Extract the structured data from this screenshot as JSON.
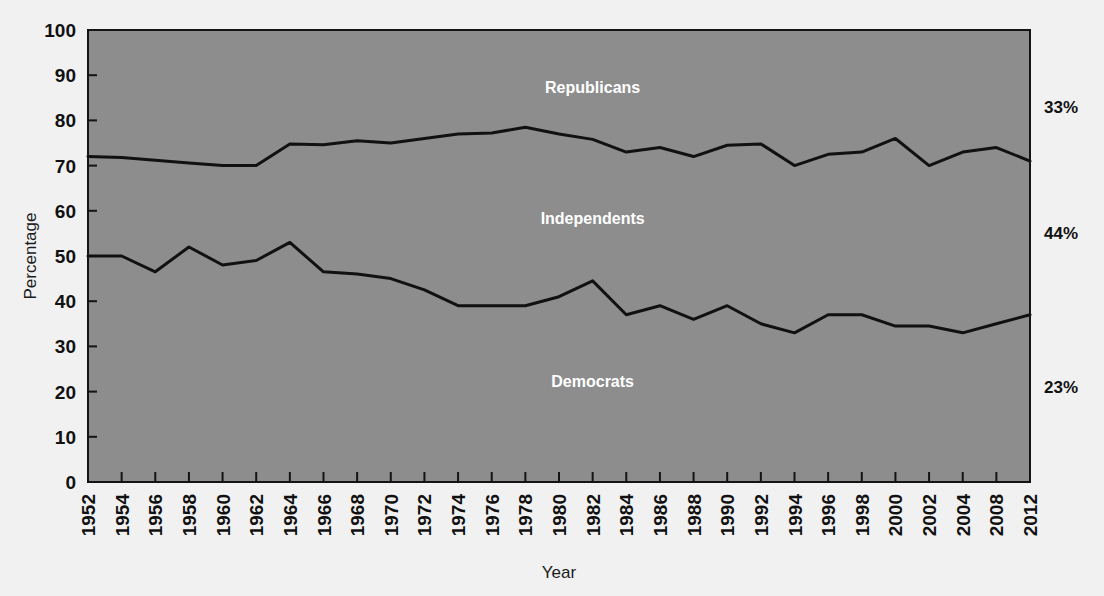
{
  "chart_data": {
    "type": "line",
    "title": "",
    "xlabel": "Year",
    "ylabel": "Percentage",
    "ylim": [
      0,
      100
    ],
    "ytick_labels": [
      "100",
      "90",
      "80",
      "70",
      "60",
      "50",
      "40",
      "30",
      "20",
      "10",
      "0"
    ],
    "ytick_values": [
      100,
      90,
      80,
      70,
      60,
      50,
      40,
      30,
      20,
      10,
      0
    ],
    "grid": false,
    "legend_position": "inline-annotations",
    "categories": [
      "1952",
      "1954",
      "1956",
      "1958",
      "1960",
      "1962",
      "1964",
      "1966",
      "1968",
      "1970",
      "1972",
      "1974",
      "1976",
      "1978",
      "1980",
      "1982",
      "1984",
      "1986",
      "1988",
      "1990",
      "1992",
      "1994",
      "1996",
      "1998",
      "2000",
      "2002",
      "2004",
      "2008",
      "2012"
    ],
    "series": [
      {
        "name": "Cumulative top boundary (Independents + Democrats)",
        "values": [
          72,
          71.8,
          71.2,
          70.6,
          70,
          70,
          74.8,
          74.6,
          75.5,
          75,
          76,
          77,
          77.2,
          78.5,
          77,
          75.8,
          73,
          74,
          72,
          74.5,
          74.8,
          70,
          72.5,
          73,
          76,
          70,
          73,
          74,
          71
        ]
      },
      {
        "name": "Democrats boundary",
        "values": [
          50,
          50,
          46.5,
          52,
          48,
          49,
          53,
          46.5,
          46,
          45,
          42.5,
          39,
          39,
          39,
          41,
          44.5,
          37,
          39,
          36,
          39,
          35,
          33,
          37,
          37,
          34.5,
          34.5,
          33,
          35,
          37
        ]
      }
    ],
    "bands": [
      {
        "name": "Republicans",
        "label": "Republicans",
        "side_label": "33%"
      },
      {
        "name": "Independents",
        "label": "Independents",
        "side_label": "44%"
      },
      {
        "name": "Democrats",
        "label": "Democrats",
        "side_label": "23%"
      }
    ],
    "annotations": [
      {
        "text": "Republicans",
        "x": 1982,
        "y": 86
      },
      {
        "text": "Independents",
        "x": 1982,
        "y": 57
      },
      {
        "text": "Democrats",
        "x": 1982,
        "y": 21
      }
    ],
    "right_axis_labels": [
      {
        "text": "33%",
        "y": 83
      },
      {
        "text": "44%",
        "y": 55
      },
      {
        "text": "23%",
        "y": 21
      }
    ],
    "colors": {
      "plot_background": "#8d8d8d",
      "line": "#111111",
      "page_background": "#f1f1f1",
      "annotation_text": "#ffffff",
      "axis_text": "#111111"
    }
  }
}
